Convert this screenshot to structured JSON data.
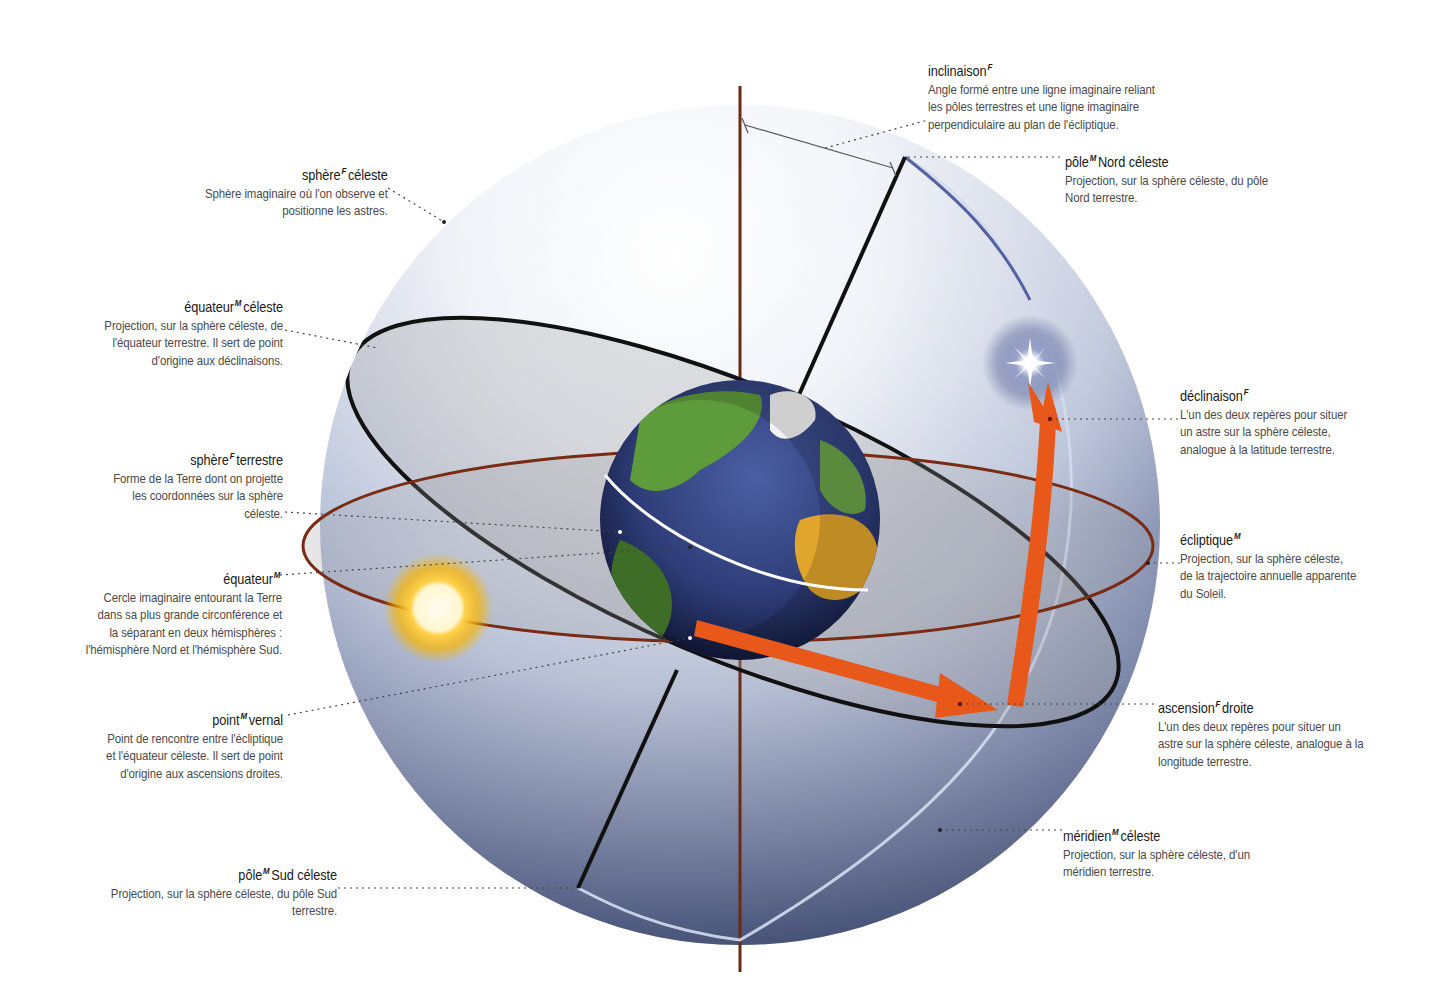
{
  "diagram": {
    "colors": {
      "sphere_light": "#eef1f7",
      "sphere_dark": "#3e4b6f",
      "ecliptic": "#7a2b14",
      "celestial_equator": "#111111",
      "axis": "#6b2a12",
      "arrow": "#e8581a",
      "meridian": "#c9d1e6",
      "sun_core": "#fffbe8",
      "sun_glow": "#f5b300",
      "star_glow": "#5a6699"
    }
  },
  "labels": {
    "inclinaison": {
      "term": "inclinaison",
      "gender": "F",
      "suffix": "",
      "desc": "Angle formé entre une ligne imaginaire reliant\nles pôles terrestres et une ligne imaginaire\nperpendiculaire au plan de l'écliptique."
    },
    "pole_nord": {
      "term": "pôle",
      "gender": "M",
      "suffix": "Nord céleste",
      "desc": "Projection, sur la sphère céleste, du pôle\nNord terrestre."
    },
    "sphere_celeste": {
      "term": "sphère",
      "gender": "F",
      "suffix": "céleste",
      "desc": "Sphère imaginaire où l'on observe et\npositionne les astres."
    },
    "equateur_celeste": {
      "term": "équateur",
      "gender": "M",
      "suffix": "céleste",
      "desc": "Projection, sur la sphère céleste, de\nl'équateur terrestre. Il sert de point\nd'origine aux déclinaisons."
    },
    "declinaison": {
      "term": "déclinaison",
      "gender": "F",
      "suffix": "",
      "desc": "L'un des deux repères pour situer\nun astre sur la sphère céleste,\nanalogue à la latitude terrestre."
    },
    "sphere_terrestre": {
      "term": "sphère",
      "gender": "F",
      "suffix": "terrestre",
      "desc": "Forme de la Terre dont on projette\nles coordonnées sur la sphère\ncéleste."
    },
    "ecliptique": {
      "term": "écliptique",
      "gender": "M",
      "suffix": "",
      "desc": "Projection, sur la sphère céleste,\nde la trajectoire annuelle apparente\ndu Soleil."
    },
    "equateur": {
      "term": "équateur",
      "gender": "M",
      "suffix": "",
      "desc": "Cercle imaginaire entourant la Terre\ndans sa plus grande circonférence et\nla séparant en deux hémisphères :\nl'hémisphère Nord et l'hémisphère Sud."
    },
    "point_vernal": {
      "term": "point",
      "gender": "M",
      "suffix": "vernal",
      "desc": "Point de rencontre entre l'écliptique\net l'équateur céleste. Il sert de point\nd'origine aux ascensions droites."
    },
    "ascension_droite": {
      "term": "ascension",
      "gender": "F",
      "suffix": "droite",
      "desc": "L'un des deux repères pour situer un\nastre sur la sphère céleste, analogue à la\nlongitude terrestre."
    },
    "meridien_celeste": {
      "term": "méridien",
      "gender": "M",
      "suffix": "céleste",
      "desc": "Projection, sur la sphère céleste, d'un\nméridien terrestre."
    },
    "pole_sud": {
      "term": "pôle",
      "gender": "M",
      "suffix": "Sud céleste",
      "desc": "Projection, sur la sphère céleste, du pôle Sud\nterrestre."
    }
  }
}
